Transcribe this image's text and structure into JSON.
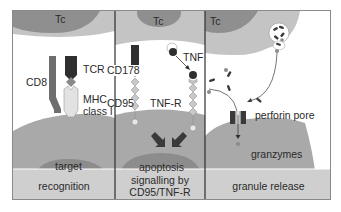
{
  "figure": {
    "panels": [
      {
        "id": "recognition",
        "cell_label": "Tc",
        "target_label": "target",
        "caption": "recognition",
        "molecules": [
          "CD8",
          "TCR",
          "MHC",
          "class I"
        ]
      },
      {
        "id": "signalling",
        "cell_label": "Tc",
        "target_label": "apoptosis",
        "caption_line1": "signalling by",
        "caption_line2": "CD95/TNF-R",
        "molecules": [
          "CD178",
          "TNF",
          "CD95",
          "TNF-R"
        ]
      },
      {
        "id": "granule",
        "cell_label": "Tc",
        "caption": "granule release",
        "molecules": [
          "perforin pore",
          "granzymes"
        ]
      }
    ],
    "colors": {
      "tc_outer": "#c4c4c4",
      "tc_nucleus": "#8f8f8f",
      "target_outer": "#a9a9a9",
      "target_nucleus": "#8c8c8c",
      "caption_band": "#cfcfcf",
      "dark": "#3a3a3a",
      "mid": "#6e6e6e",
      "light": "#e2e2e2",
      "divider": "#2e2e2e"
    }
  }
}
